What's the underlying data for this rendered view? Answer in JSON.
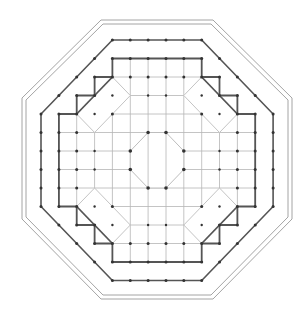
{
  "diagram": {
    "type": "architectural-floor-plan",
    "shape": "octagon",
    "colors": {
      "line_dark": "#555555",
      "line_light": "#b5b5b5",
      "dot": "#333333",
      "background": "#ffffff"
    },
    "grid": {
      "columns": [
        41,
        58.9,
        76.7,
        94.6,
        112.4,
        130.3,
        148.1,
        166,
        183.8,
        201.7,
        219.5,
        237.4,
        255.2,
        273.1
      ],
      "rows": [
        40,
        58.5,
        77,
        95.5,
        114,
        132.5,
        151,
        169.5,
        188,
        206.5,
        225,
        243.5,
        262,
        280.5
      ]
    },
    "outer_frame": {
      "outer": "101,20 213,20 292,98 292,219 213,299 101,299 22,219 22,98",
      "inner": "103,24 211,24 288,100 288,217 211,295 103,295 26,217 26,100"
    },
    "colonnade_ring": "112.4,40 201.7,40 273.1,114 273.1,206.5 201.7,280.5 112.4,280.5 41,206.5 41,114",
    "stepped_ring": "112.4,58.5 201.7,58.5 201.7,77 219.5,77 219.5,95.5 237.4,95.5 237.4,114 255.2,114 255.2,206.5 237.4,206.5 237.4,225 219.5,225 219.5,243.5 201.7,243.5 201.7,262 112.4,262 112.4,243.5 94.6,243.5 94.6,225 76.7,225 76.7,206.5 58.9,206.5 58.9,114 76.7,114 76.7,95.5 94.6,95.5 94.6,77 112.4,77",
    "corner_diagonals": [
      [
        112.4,
        77,
        76.7,
        114
      ],
      [
        201.7,
        77,
        237.4,
        114
      ],
      [
        237.4,
        206.5,
        201.7,
        243.5
      ],
      [
        76.7,
        206.5,
        112.4,
        243.5
      ]
    ],
    "corner_chambers": [
      "112.4,77 130.3,95.5 94.6,132.5 76.7,114",
      "201.7,77 183.8,95.5 219.5,132.5 237.4,114",
      "219.5,188 237.4,206.5 201.7,243.5 183.8,225",
      "94.6,188 76.7,206.5 112.4,243.5 130.3,225"
    ],
    "central_octagon": "148.1,132.5 166,132.5 183.8,151 183.8,169.5 166,188 148.1,188 130.3,169.5 130.3,151",
    "labels": []
  }
}
